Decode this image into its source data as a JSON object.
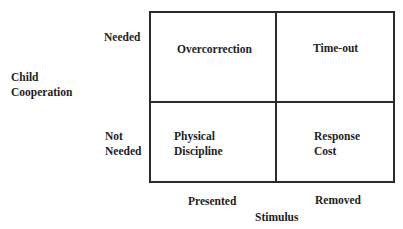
{
  "y_axis": {
    "title_line1": "Child",
    "title_line2": "Cooperation",
    "rows": [
      {
        "line1": "Needed",
        "line2": ""
      },
      {
        "line1": "Not",
        "line2": "Needed"
      }
    ]
  },
  "x_axis": {
    "title": "Stimulus",
    "columns": [
      "Presented",
      "Removed"
    ]
  },
  "cells": {
    "top_left": {
      "line1": "Overcorrection",
      "line2": ""
    },
    "top_right": {
      "line1": "Time-out",
      "line2": ""
    },
    "bottom_left": {
      "line1": "Physical",
      "line2": "Discipline"
    },
    "bottom_right": {
      "line1": "Response",
      "line2": "Cost"
    }
  },
  "colors": {
    "line": "#2a2a2a",
    "text": "#1e1e1e",
    "background": "#ffffff"
  }
}
